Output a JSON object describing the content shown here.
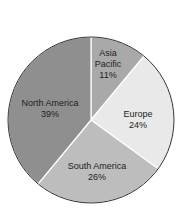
{
  "chart_data": {
    "type": "pie",
    "title": "",
    "categories": [
      "Asia Pacific",
      "Europe",
      "South America",
      "North America"
    ],
    "values": [
      11,
      24,
      26,
      39
    ],
    "unit": "%",
    "labels": [
      {
        "name_lines": [
          "Asia",
          "Pacific"
        ],
        "pct": "11%"
      },
      {
        "name_lines": [
          "Europe"
        ],
        "pct": "24%"
      },
      {
        "name_lines": [
          "South America"
        ],
        "pct": "26%"
      },
      {
        "name_lines": [
          "North America"
        ],
        "pct": "39%"
      }
    ],
    "colors": [
      "#a9a9a9",
      "#e9e9e9",
      "#bdbdbd",
      "#8f8f8f"
    ],
    "legend": "none"
  }
}
